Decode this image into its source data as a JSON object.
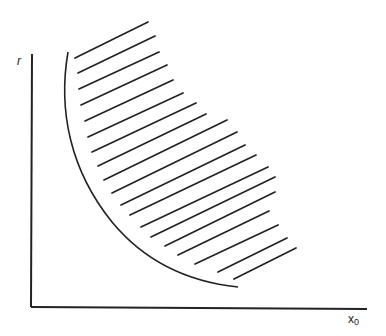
{
  "diagram": {
    "y_axis_label": "r",
    "x_axis_label_base": "x",
    "x_axis_label_sub": "0",
    "stroke_color": "#222222",
    "background": "#ffffff",
    "axes": {
      "origin": [
        31,
        307
      ],
      "y_top": [
        32,
        54
      ],
      "x_end": [
        367,
        309
      ]
    },
    "boundary_curve": {
      "description": "convex decreasing boundary curve",
      "path": "M 68 52 C 58 110, 70 170, 112 222 C 145 262, 190 282, 238 287"
    },
    "hatch_region": "shaded region to the right of the boundary curve",
    "hatch_lines": [
      [
        75,
        58,
        148,
        22
      ],
      [
        78,
        73,
        155,
        36
      ],
      [
        79,
        89,
        159,
        52
      ],
      [
        81,
        105,
        167,
        65
      ],
      [
        85,
        121,
        173,
        80
      ],
      [
        88,
        137,
        183,
        93
      ],
      [
        92,
        152,
        196,
        103
      ],
      [
        98,
        166,
        206,
        114
      ],
      [
        104,
        180,
        227,
        120
      ],
      [
        112,
        193,
        237,
        132
      ],
      [
        121,
        205,
        245,
        145
      ],
      [
        130,
        215,
        256,
        155
      ],
      [
        141,
        227,
        268,
        167
      ],
      [
        151,
        237,
        275,
        177
      ],
      [
        165,
        246,
        275,
        192
      ],
      [
        178,
        255,
        269,
        211
      ],
      [
        195,
        264,
        278,
        225
      ],
      [
        218,
        272,
        287,
        238
      ],
      [
        234,
        279,
        296,
        248
      ]
    ]
  }
}
